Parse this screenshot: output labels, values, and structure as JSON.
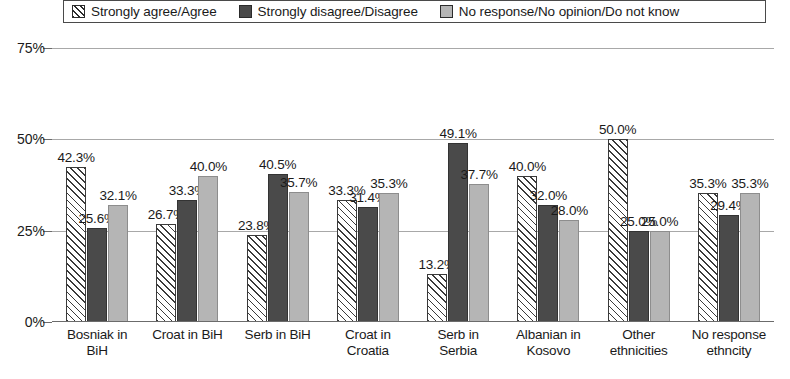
{
  "chart_data": {
    "type": "bar",
    "title": "",
    "subtitle": "",
    "xlabel": "",
    "ylabel": "",
    "ylim": [
      0,
      78
    ],
    "ytick_labels": [
      "75%",
      "50%",
      "25%",
      "0%"
    ],
    "ytick_values": [
      75,
      50,
      25,
      0
    ],
    "grid": true,
    "legend_position": "top",
    "categories": [
      "Bosniak in BiH",
      "Croat in BiH",
      "Serb in BiH",
      "Croat in Croatia",
      "Serb in Serbia",
      "Albanian in Kosovo",
      "Other ethnicities",
      "No response ethncity"
    ],
    "category_lines": [
      [
        "Bosniak in",
        "BiH"
      ],
      [
        "Croat in BiH",
        ""
      ],
      [
        "Serb in BiH",
        ""
      ],
      [
        "Croat in",
        "Croatia"
      ],
      [
        "Serb in",
        "Serbia"
      ],
      [
        "Albanian in",
        "Kosovo"
      ],
      [
        "Other",
        "ethnicities"
      ],
      [
        "No response",
        "ethncity"
      ]
    ],
    "series": [
      {
        "name": "Strongly agree/Agree",
        "color": "#ffffff",
        "pattern": "diagonal-hatch",
        "values": [
          42.3,
          26.7,
          23.8,
          33.3,
          13.2,
          40.0,
          50.0,
          35.3
        ],
        "labels": [
          "42.3%",
          "26.7%",
          "23.8%",
          "33.3%",
          "13.2%",
          "40.0%",
          "50.0%",
          "35.3%"
        ]
      },
      {
        "name": "Strongly disagree/Disagree",
        "color": "#4a4a4a",
        "pattern": "solid",
        "values": [
          25.6,
          33.3,
          40.5,
          31.4,
          49.1,
          32.0,
          25.0,
          29.4
        ],
        "labels": [
          "25.6%",
          "33.3%",
          "40.5%",
          "31.4%",
          "49.1%",
          "32.0%",
          "25.0%",
          "29.4%"
        ]
      },
      {
        "name": "No response/No opinion/Do not know",
        "color": "#b5b5b5",
        "pattern": "solid",
        "values": [
          32.1,
          40.0,
          35.7,
          35.3,
          37.7,
          28.0,
          25.0,
          35.3
        ],
        "labels": [
          "32.1%",
          "40.0%",
          "35.7%",
          "35.3%",
          "37.7%",
          "28.0%",
          "25.0%",
          "35.3%"
        ]
      }
    ]
  },
  "legend": {
    "items": [
      {
        "label": "Strongly agree/Agree",
        "swatch": "hatch-swatch-icon"
      },
      {
        "label": "Strongly disagree/Disagree",
        "swatch": "dark-gray-swatch-icon"
      },
      {
        "label": "No response/No opinion/Do not know",
        "swatch": "light-gray-swatch-icon"
      }
    ]
  }
}
